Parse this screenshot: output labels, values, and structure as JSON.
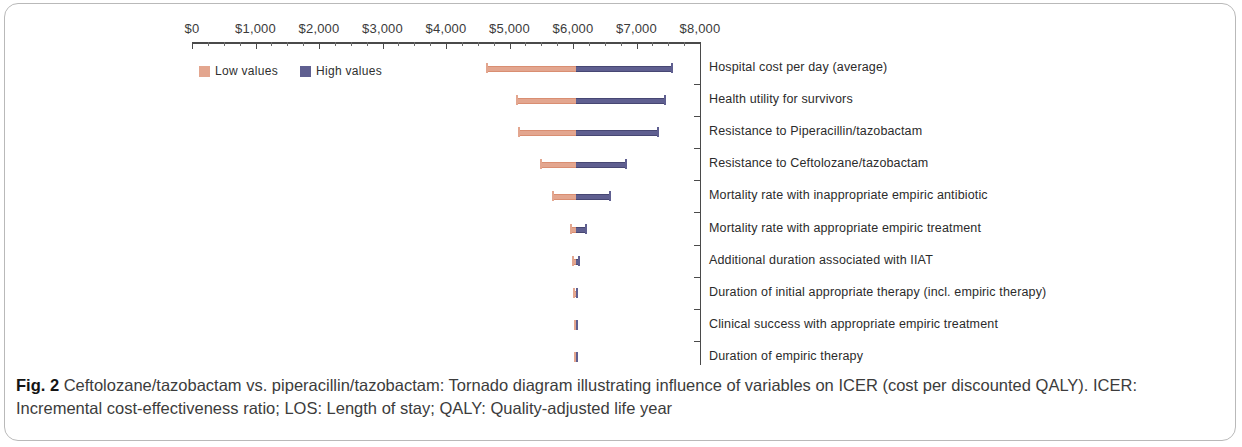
{
  "figure": {
    "label": "Fig. 2",
    "caption_main": " Ceftolozane/tazobactam vs. piperacillin/tazobactam: Tornado diagram illustrating influence of variables on ICER (cost per discounted QALY). ICER: Incremental cost-effectiveness ratio; LOS: Length of stay; QALY: Quality-adjusted life year"
  },
  "legend": {
    "position": "top-left",
    "entries": [
      {
        "label": "Low values",
        "color": "#e3a68f"
      },
      {
        "label": "High values",
        "color": "#5f5f90"
      }
    ]
  },
  "chart_data": {
    "type": "bar",
    "subtype": "tornado",
    "title": "",
    "xlabel": "",
    "ylabel": "",
    "xlim": [
      0,
      8000
    ],
    "xtick_labels": [
      "$0",
      "$1,000",
      "$2,000",
      "$3,000",
      "$4,000",
      "$5,000",
      "$6,000",
      "$7,000",
      "$8,000"
    ],
    "xtick_values": [
      0,
      1000,
      2000,
      3000,
      4000,
      5000,
      6000,
      7000,
      8000
    ],
    "minor_tick_interval": 250,
    "grid": false,
    "baseline": 6045,
    "axis_units": "USD per discounted QALY",
    "series": [
      {
        "name": "Low values",
        "color": "#e3a68f"
      },
      {
        "name": "High values",
        "color": "#5f5f90"
      }
    ],
    "categories": [
      "Hospital cost per day (average)",
      "Health utility for survivors",
      "Resistance to Piperacillin/tazobactam",
      "Resistance to Ceftolozane/tazobactam",
      "Mortality rate with inappropriate empiric antibiotic",
      "Mortality rate with appropriate empiric treatment",
      "Additional duration associated with IIAT",
      "Duration of initial appropriate therapy (incl. empiric therapy)",
      "Clinical success with appropriate empiric treatment",
      "Duration of empiric therapy"
    ],
    "bars": [
      {
        "category": "Hospital cost per day (average)",
        "low": 4650,
        "high": 7560
      },
      {
        "category": "Health utility for survivors",
        "low": 5120,
        "high": 7450
      },
      {
        "category": "Resistance to Piperacillin/tazobactam",
        "low": 5150,
        "high": 7340
      },
      {
        "category": "Resistance to Ceftolozane/tazobactam",
        "low": 5500,
        "high": 6830
      },
      {
        "category": "Mortality rate with inappropriate empiric antibiotic",
        "low": 5690,
        "high": 6590
      },
      {
        "category": "Mortality rate with appropriate empiric treatment",
        "low": 5970,
        "high": 6210
      },
      {
        "category": "Additional duration associated with IIAT",
        "low": 6000,
        "high": 6100
      },
      {
        "category": "Duration of initial appropriate therapy (incl. empiric therapy)",
        "low": 6020,
        "high": 6070
      },
      {
        "category": "Clinical success with appropriate empiric treatment",
        "low": 6025,
        "high": 6065
      },
      {
        "category": "Duration of empiric therapy",
        "low": 6030,
        "high": 6060
      }
    ]
  }
}
